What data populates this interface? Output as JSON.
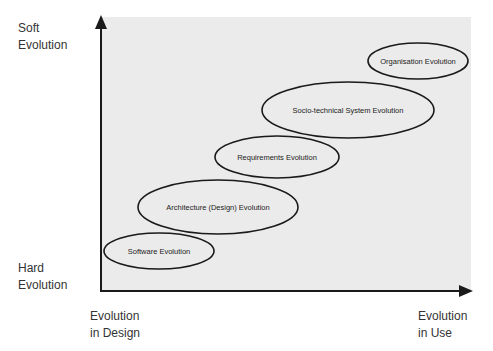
{
  "diagram": {
    "y_axis": {
      "top_label": [
        "Soft",
        "Evolution"
      ],
      "bottom_label": [
        "Hard",
        "Evolution"
      ]
    },
    "x_axis": {
      "left_label": [
        "Evolution",
        "in Design"
      ],
      "right_label": [
        "Evolution",
        "in Use"
      ]
    },
    "colors": {
      "background": "#ebebeb",
      "stroke": "#1a1a1a"
    },
    "ellipses": [
      {
        "label": "Software Evolution",
        "cx": 159,
        "cy": 251,
        "rx": 55,
        "ry": 18
      },
      {
        "label": "Architecture (Design) Evolution",
        "cx": 218,
        "cy": 207,
        "rx": 80,
        "ry": 27
      },
      {
        "label": "Requirements Evolution",
        "cx": 277,
        "cy": 157,
        "rx": 62,
        "ry": 21
      },
      {
        "label": "Socio-technical System Evolution",
        "cx": 348,
        "cy": 110,
        "rx": 86,
        "ry": 28
      },
      {
        "label": "Organisation Evolution",
        "cx": 418,
        "cy": 61,
        "rx": 50,
        "ry": 18
      }
    ]
  }
}
